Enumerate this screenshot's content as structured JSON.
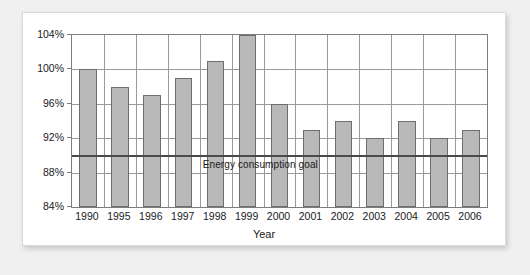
{
  "chart_data": {
    "type": "bar",
    "title": "",
    "xlabel": "Year",
    "ylabel": "",
    "categories": [
      "1990",
      "1995",
      "1996",
      "1997",
      "1998",
      "1999",
      "2000",
      "2001",
      "2002",
      "2003",
      "2004",
      "2005",
      "2006"
    ],
    "values": [
      100,
      98,
      97,
      99,
      101,
      104,
      96,
      93,
      94,
      92,
      94,
      92,
      93
    ],
    "ylim": [
      84,
      104
    ],
    "ytick_step": 4,
    "ytick_labels": [
      "84%",
      "88%",
      "92%",
      "96%",
      "100%",
      "104%"
    ],
    "ytick_values": [
      84,
      88,
      92,
      96,
      100,
      104
    ],
    "grid": true,
    "legend": "none",
    "annotations": [
      {
        "name": "energy-consumption-goal",
        "label": "Energy consumption goal",
        "type": "hline",
        "value": 90
      }
    ],
    "colors": {
      "bar_fill": "#b9b9b9",
      "bar_border": "#6e6e6e",
      "grid": "#9a9a9a",
      "axis": "#7d7d7d",
      "goal_line": "#4a4a4a",
      "card_background": "#ffffff",
      "page_background": "#f0f0f0",
      "text": "#1a1a1a"
    }
  }
}
